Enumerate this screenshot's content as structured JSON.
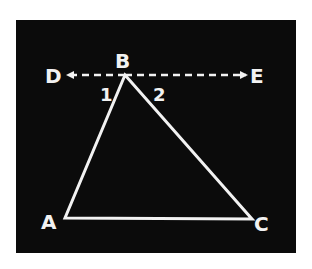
{
  "diagram": {
    "colors": {
      "background": "#0b0b0b",
      "stroke": "#f2f2f2",
      "page": "#ffffff"
    },
    "points": {
      "A": {
        "label": "A",
        "x": 65,
        "y": 218
      },
      "B": {
        "label": "B",
        "x": 125,
        "y": 75
      },
      "C": {
        "label": "C",
        "x": 252,
        "y": 219
      },
      "D": {
        "label": "D"
      },
      "E": {
        "label": "E"
      }
    },
    "angles": {
      "angle1": {
        "label": "1"
      },
      "angle2": {
        "label": "2"
      }
    },
    "segments": [
      "AB",
      "BC",
      "AC"
    ],
    "dashed_line": {
      "label": "DE",
      "through": "B",
      "arrows": "both",
      "parallel_to": "AC"
    }
  }
}
